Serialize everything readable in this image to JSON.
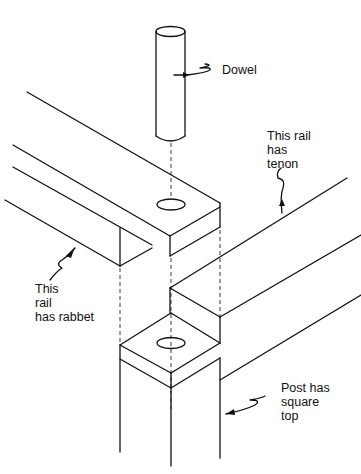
{
  "diagram": {
    "labels": {
      "dowel": "Dowel",
      "tenon_rail": [
        "This rail",
        "has",
        "tenon"
      ],
      "rabbet_rail": [
        "This",
        "rail",
        "has rabbet"
      ],
      "post": [
        "Post has",
        "square",
        "top"
      ]
    },
    "parts": [
      "dowel",
      "rail-with-rabbet",
      "rail-with-tenon",
      "post-square-top"
    ],
    "colors": {
      "line": "#111111",
      "background": "#ffffff"
    }
  }
}
